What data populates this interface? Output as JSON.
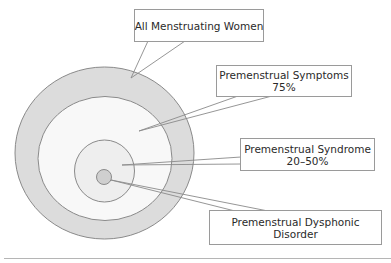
{
  "diagram": {
    "type": "nested-circles",
    "colors": {
      "ring_fill": "#dcdcdc",
      "inner_fill": "#f8f8f8",
      "stroke": "#8a8a8a"
    },
    "labels": [
      {
        "id": "all",
        "line1": "All Menstruating Women",
        "line2": ""
      },
      {
        "id": "symptoms",
        "line1": "Premenstrual Symptoms",
        "line2": "75%"
      },
      {
        "id": "syndrome",
        "line1": "Premenstrual Syndrome",
        "line2": "20–50%"
      },
      {
        "id": "disorder",
        "line1": "Premenstrual Dysphonic",
        "line2": "Disorder"
      }
    ]
  }
}
